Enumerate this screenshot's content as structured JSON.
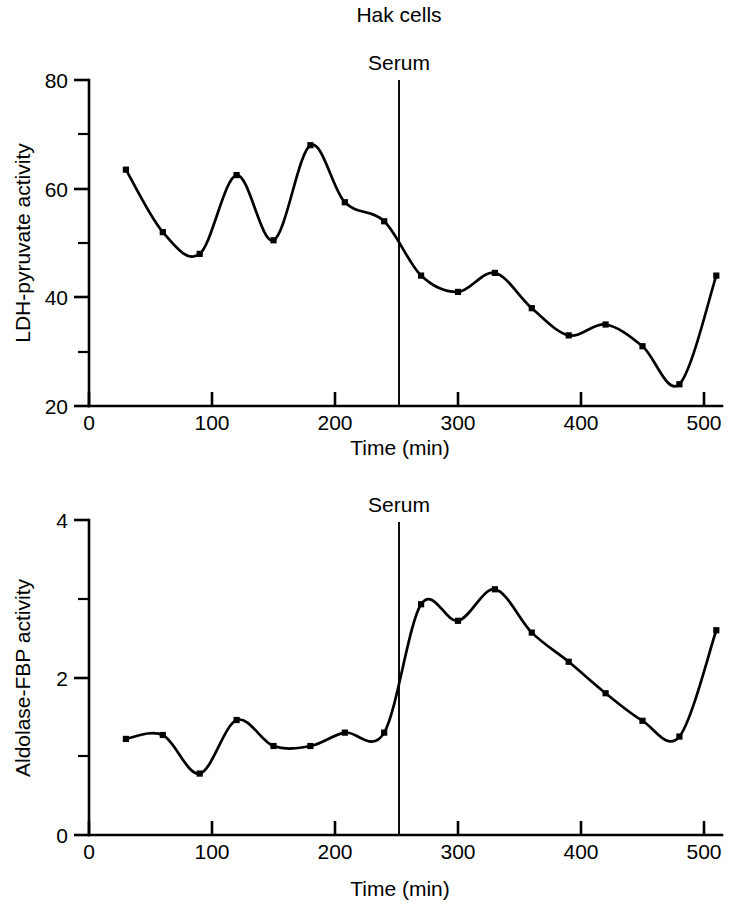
{
  "figure": {
    "title": "Hak cells",
    "background": "#ffffff",
    "ink_color": "#000000"
  },
  "chart_data": [
    {
      "id": "ldh-pyruvate",
      "type": "line",
      "title": "Hak cells",
      "xlabel": "Time (min)",
      "ylabel": "LDH-pyruvate activity",
      "xlim": [
        0,
        515
      ],
      "ylim": [
        20,
        80
      ],
      "xticks": [
        0,
        100,
        200,
        300,
        400,
        500
      ],
      "xtick_labels": [
        "0",
        "100",
        "200",
        "300",
        "400",
        "500"
      ],
      "yticks": [
        20,
        40,
        60,
        80
      ],
      "ytick_labels": [
        "20",
        "40",
        "60",
        "80"
      ],
      "yminor_ticks": [
        30,
        50,
        70
      ],
      "grid": false,
      "legend": "none",
      "markers": "filled-square",
      "annotations": [
        {
          "label": "Serum",
          "type": "vline",
          "x": 252
        }
      ],
      "x": [
        30,
        60,
        90,
        120,
        150,
        180,
        208,
        240,
        270,
        300,
        330,
        360,
        390,
        420,
        450,
        480,
        510
      ],
      "values": [
        63.5,
        52.0,
        48.0,
        62.5,
        50.5,
        68.0,
        57.5,
        54.0,
        44.0,
        41.0,
        44.5,
        38.0,
        33.0,
        35.0,
        31.0,
        24.0,
        44.0
      ]
    },
    {
      "id": "aldolase-fbp",
      "type": "line",
      "title": "",
      "xlabel": "Time (min)",
      "ylabel": "Aldolase-FBP activity",
      "xlim": [
        0,
        515
      ],
      "ylim": [
        0,
        4
      ],
      "xticks": [
        0,
        100,
        200,
        300,
        400,
        500
      ],
      "xtick_labels": [
        "0",
        "100",
        "200",
        "300",
        "400",
        "500"
      ],
      "yticks": [
        0,
        2,
        4
      ],
      "ytick_labels": [
        "0",
        "2",
        "4"
      ],
      "yminor_ticks": [
        1,
        3
      ],
      "grid": false,
      "legend": "none",
      "markers": "filled-square",
      "annotations": [
        {
          "label": "Serum",
          "type": "vline",
          "x": 252
        }
      ],
      "x": [
        30,
        60,
        90,
        120,
        150,
        180,
        208,
        240,
        270,
        300,
        330,
        360,
        390,
        420,
        450,
        480,
        510
      ],
      "values": [
        1.22,
        1.27,
        0.78,
        1.46,
        1.13,
        1.13,
        1.3,
        1.3,
        2.93,
        2.72,
        3.12,
        2.57,
        2.2,
        1.8,
        1.45,
        1.25,
        2.6
      ]
    }
  ]
}
